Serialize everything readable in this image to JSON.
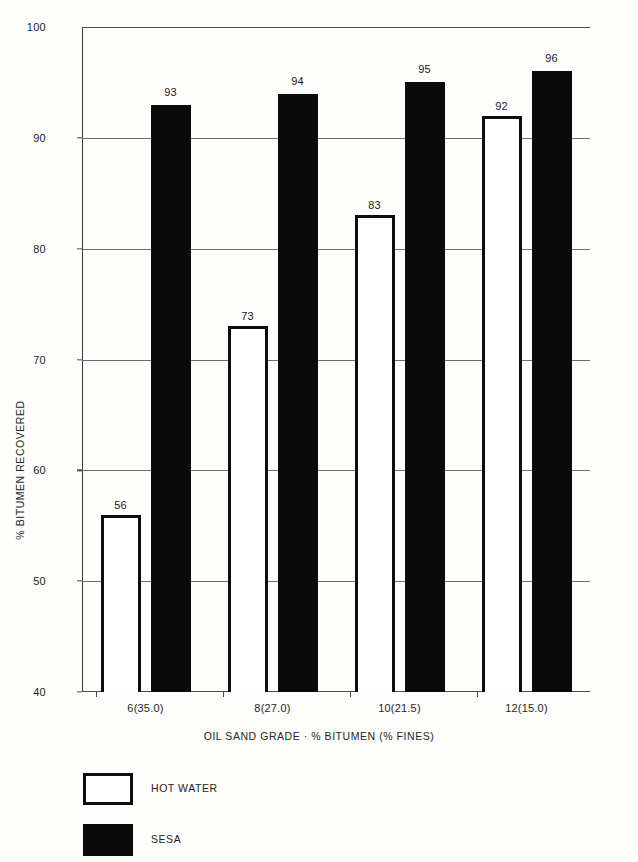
{
  "chart_data": {
    "type": "bar",
    "title": "",
    "subtitle": "",
    "xlabel": "OIL SAND GRADE · % BITUMEN (% FINES)",
    "ylabel": "% BITUMEN RECOVERED",
    "categories": [
      "6(35.0)",
      "8(27.0)",
      "10(21.5)",
      "12(15.0)"
    ],
    "series": [
      {
        "name": "HOT WATER",
        "values": [
          56,
          73,
          83,
          92
        ],
        "style": "outline",
        "color": "#ffffff",
        "edge_color": "#0d0d0d"
      },
      {
        "name": "SESA",
        "values": [
          93,
          94,
          95,
          96
        ],
        "style": "solid",
        "color": "#0a0a0a",
        "edge_color": "#0a0a0a"
      }
    ],
    "ylim": [
      40,
      100
    ],
    "yticks": [
      40,
      50,
      60,
      70,
      80,
      90,
      100
    ],
    "ytick_labels": [
      "40",
      "50",
      "60",
      "70",
      "80",
      "90",
      "100"
    ],
    "grid": true,
    "grid_axis": "y",
    "legend_position": "below-left",
    "data_labels": true,
    "bar_value_labels": [
      [
        "56",
        "93"
      ],
      [
        "73",
        "94"
      ],
      [
        "83",
        "95"
      ],
      [
        "92",
        "96"
      ]
    ],
    "background_color": "#fdfdfc",
    "axis_color": "#4a4a4a"
  },
  "legend": {
    "items": [
      {
        "label": "HOT WATER",
        "swatch": "outline"
      },
      {
        "label": "SESA",
        "swatch": "solid"
      }
    ]
  }
}
